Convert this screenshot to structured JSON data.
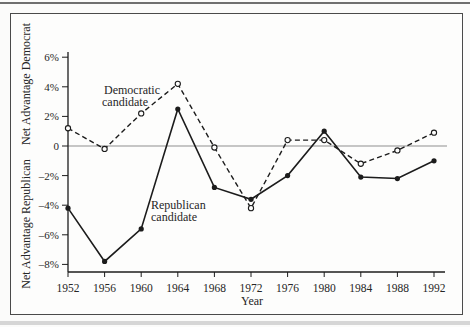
{
  "figure": {
    "kind": "book-figure-line-chart"
  },
  "chart_data": {
    "type": "line",
    "x": [
      1952,
      1956,
      1960,
      1964,
      1968,
      1972,
      1976,
      1980,
      1984,
      1988,
      1992
    ],
    "xlabel": "Year",
    "ylabel_top": "Net Advantage Democrat",
    "ylabel_bottom": "Net Advantage Republican",
    "ylim": [
      -8.8,
      6.8
    ],
    "ytick_values": [
      6,
      4,
      2,
      0,
      -2,
      -4,
      -6,
      -8
    ],
    "ytick_labels": [
      "6%",
      "4%",
      "2%",
      "0",
      "–2%",
      "–4%",
      "–6%",
      "–8%"
    ],
    "grid": false,
    "legend_position": "inline-annotations",
    "series": [
      {
        "name": "Democratic candidate",
        "style": "dashed",
        "marker": "open-circle",
        "color": "#1c1c1c",
        "values": [
          1.2,
          -0.2,
          2.2,
          4.2,
          -0.1,
          -4.2,
          0.4,
          0.4,
          -1.2,
          -0.3,
          0.9
        ]
      },
      {
        "name": "Republican candidate",
        "style": "solid",
        "marker": "filled-circle",
        "color": "#1c1c1c",
        "values": [
          -4.2,
          -7.8,
          -5.6,
          2.5,
          -2.8,
          -3.6,
          -2.0,
          1.0,
          -2.1,
          -2.2,
          -1.0
        ]
      }
    ],
    "annotations": [
      {
        "text_lines": [
          "Democratic",
          "candidate"
        ],
        "x": 103,
        "y": 94,
        "series": "Democratic candidate"
      },
      {
        "text_lines": [
          "Republican",
          "candidate"
        ],
        "x": 151,
        "y": 209,
        "series": "Republican candidate"
      }
    ],
    "zero_line_color": "#8f8f8f",
    "axis_color": "#1c1c1c"
  }
}
